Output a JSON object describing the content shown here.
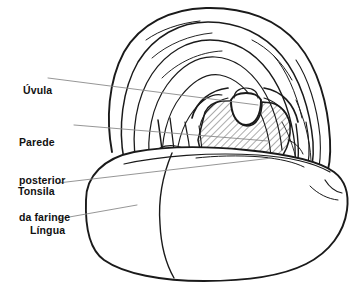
{
  "figure": {
    "style": "line-drawing",
    "background_color": "#ffffff",
    "ink_color": "#1a1a1a",
    "leader_color": "#8a8a8a",
    "hatch_color": "#3a3a3a"
  },
  "labels": [
    {
      "id": "uvula",
      "text": "Úvula",
      "lines": [
        "Úvula"
      ]
    },
    {
      "id": "parede",
      "text": "Parede posterior da faringe",
      "lines": [
        "Parede",
        "posterior",
        "da faringe"
      ]
    },
    {
      "id": "tonsila",
      "text": "Tonsila",
      "lines": [
        "Tonsila"
      ]
    },
    {
      "id": "lingua",
      "text": "Língua",
      "lines": [
        "Língua"
      ]
    }
  ],
  "label_text": {
    "uvula": "Úvula",
    "parede_line1": "Parede",
    "parede_line2": "posterior",
    "parede_line3": "da faringe",
    "tonsila": "Tonsila",
    "lingua": "Língua"
  },
  "leaders": [
    {
      "id": "uvula-leader",
      "from": [
        48,
        78
      ],
      "to": [
        258,
        105
      ]
    },
    {
      "id": "parede-leader",
      "from": [
        74,
        125
      ],
      "to": [
        268,
        141
      ]
    },
    {
      "id": "tonsila-leader",
      "from": [
        58,
        183
      ],
      "to": [
        272,
        158
      ]
    },
    {
      "id": "lingua-leader",
      "from": [
        58,
        219
      ],
      "to": [
        137,
        205
      ]
    }
  ],
  "structures": [
    {
      "id": "soft-palate",
      "name": "Palato mole / arco palatino"
    },
    {
      "id": "uvula",
      "name": "Úvula"
    },
    {
      "id": "posterior-pharynx",
      "name": "Parede posterior da faringe",
      "fill": "hatched"
    },
    {
      "id": "tonsil-left",
      "name": "Tonsila palatina esquerda"
    },
    {
      "id": "tonsil-right",
      "name": "Tonsila palatina direita"
    },
    {
      "id": "tongue",
      "name": "Língua"
    }
  ]
}
